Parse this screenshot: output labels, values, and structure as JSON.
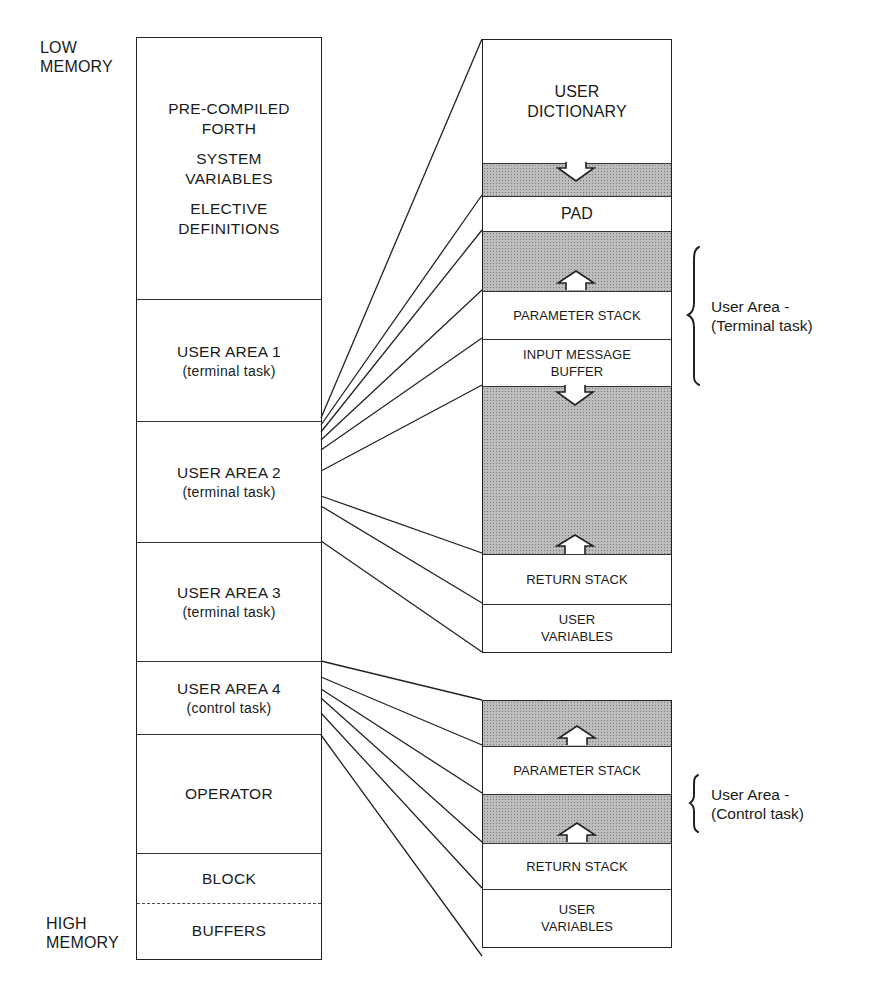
{
  "diagram": {
    "labels": {
      "low_memory": [
        "LOW",
        "MEMORY"
      ],
      "high_memory": [
        "HIGH",
        "MEMORY"
      ]
    },
    "memory_map": {
      "regions": [
        {
          "lines": [
            "PRE-COMPILED",
            "FORTH",
            "",
            "SYSTEM",
            "VARIABLES",
            "",
            "ELECTIVE",
            "DEFINITIONS"
          ]
        },
        {
          "title": "USER AREA 1",
          "subtitle": "(terminal task)"
        },
        {
          "title": "USER AREA 2",
          "subtitle": "(terminal task)"
        },
        {
          "title": "USER AREA 3",
          "subtitle": "(terminal task)"
        },
        {
          "title": "USER AREA 4",
          "subtitle": "(control task)"
        },
        {
          "title": "OPERATOR"
        },
        {
          "title": "BLOCK"
        },
        {
          "title": "BUFFERS"
        }
      ]
    },
    "terminal_user_area": {
      "regions": [
        {
          "lines": [
            "USER",
            "DICTIONARY"
          ],
          "shaded": false
        },
        {
          "label": "",
          "shaded": true,
          "arrow": "down"
        },
        {
          "label": "PAD",
          "shaded": false
        },
        {
          "label": "",
          "shaded": true,
          "arrow": "up"
        },
        {
          "label": "PARAMETER STACK",
          "shaded": false
        },
        {
          "lines": [
            "INPUT MESSAGE",
            "BUFFER"
          ],
          "shaded": false
        },
        {
          "label": "",
          "shaded": true,
          "arrow_top": "down",
          "arrow_bottom": "up"
        },
        {
          "label": "RETURN STACK",
          "shaded": false
        },
        {
          "lines": [
            "USER",
            "VARIABLES"
          ],
          "shaded": false
        }
      ],
      "annotation": [
        "User Area -",
        "(Terminal task)"
      ]
    },
    "control_user_area": {
      "regions": [
        {
          "label": "",
          "shaded": true,
          "arrow": "up"
        },
        {
          "label": "PARAMETER STACK",
          "shaded": false
        },
        {
          "label": "",
          "shaded": true,
          "arrow": "up"
        },
        {
          "label": "RETURN STACK",
          "shaded": false
        },
        {
          "lines": [
            "USER",
            "VARIABLES"
          ],
          "shaded": false
        }
      ],
      "annotation": [
        "User Area -",
        "(Control task)"
      ]
    },
    "colors": {
      "line": "#222222",
      "shade": "#bdbdbd",
      "background": "#ffffff"
    }
  }
}
